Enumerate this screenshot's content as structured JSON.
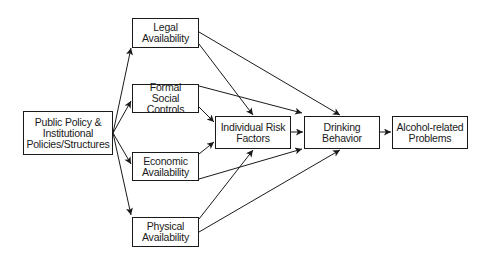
{
  "diagram": {
    "nodes": {
      "public_policy": {
        "label": "Public Policy &\nInstitutional\nPolicies/Structures"
      },
      "legal": {
        "label": "Legal\nAvailability"
      },
      "formal": {
        "label": "Formal Social\nControls"
      },
      "economic": {
        "label": "Economic\nAvailability"
      },
      "physical": {
        "label": "Physical\nAvailability"
      },
      "individual": {
        "label": "Individual Risk\nFactors"
      },
      "drinking": {
        "label": "Drinking\nBehavior"
      },
      "problems": {
        "label": "Alcohol-related\nProblems"
      }
    },
    "edges": [
      {
        "from": "public_policy",
        "to": "legal"
      },
      {
        "from": "public_policy",
        "to": "formal"
      },
      {
        "from": "public_policy",
        "to": "economic"
      },
      {
        "from": "public_policy",
        "to": "physical"
      },
      {
        "from": "legal",
        "to": "individual"
      },
      {
        "from": "legal",
        "to": "drinking"
      },
      {
        "from": "formal",
        "to": "individual"
      },
      {
        "from": "formal",
        "to": "drinking"
      },
      {
        "from": "economic",
        "to": "individual"
      },
      {
        "from": "economic",
        "to": "drinking"
      },
      {
        "from": "physical",
        "to": "individual"
      },
      {
        "from": "physical",
        "to": "drinking"
      },
      {
        "from": "individual",
        "to": "drinking"
      },
      {
        "from": "drinking",
        "to": "problems"
      }
    ],
    "colors": {
      "stroke": "#1a1a1a",
      "background": "#ffffff"
    }
  }
}
